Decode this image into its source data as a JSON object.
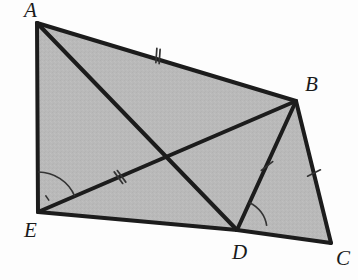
{
  "figure": {
    "kind": "geometry-diagram",
    "width": 358,
    "height": 280,
    "background_color": "#fdfdfd",
    "fill_color": "#b9b9b9",
    "stroke_color": "#1c1c1c",
    "thin_stroke_color": "#333333"
  },
  "vertices": [
    {
      "name": "A",
      "x": 37,
      "y": 23,
      "label": "A",
      "label_x": 24,
      "label_y": 0
    },
    {
      "name": "B",
      "x": 296,
      "y": 101,
      "label": "B",
      "label_x": 305,
      "label_y": 74
    },
    {
      "name": "C",
      "x": 331,
      "y": 243,
      "label": "C",
      "label_x": 336,
      "label_y": 248
    },
    {
      "name": "D",
      "x": 237,
      "y": 230,
      "label": "D",
      "label_x": 232,
      "label_y": 242
    },
    {
      "name": "E",
      "x": 38,
      "y": 212,
      "label": "E",
      "label_x": 24,
      "label_y": 220
    }
  ],
  "polygon": {
    "name": "pentagon-abcde",
    "points": "37,23 296,101 331,243 237,230 38,212"
  },
  "segments": [
    {
      "name": "side-AB",
      "from": "A",
      "to": "B",
      "x1": 37,
      "y1": 23,
      "x2": 296,
      "y2": 101,
      "width": 4
    },
    {
      "name": "side-BC",
      "from": "B",
      "to": "C",
      "x1": 296,
      "y1": 101,
      "x2": 331,
      "y2": 243,
      "width": 4
    },
    {
      "name": "side-CD",
      "from": "C",
      "to": "D",
      "x1": 331,
      "y1": 243,
      "x2": 237,
      "y2": 230,
      "width": 4
    },
    {
      "name": "side-DE",
      "from": "D",
      "to": "E",
      "x1": 237,
      "y1": 230,
      "x2": 38,
      "y2": 212,
      "width": 4
    },
    {
      "name": "side-EA",
      "from": "E",
      "to": "A",
      "x1": 38,
      "y1": 212,
      "x2": 37,
      "y2": 23,
      "width": 4
    },
    {
      "name": "diagonal-AD",
      "from": "A",
      "to": "D",
      "x1": 37,
      "y1": 23,
      "x2": 237,
      "y2": 230,
      "width": 4
    },
    {
      "name": "diagonal-EB",
      "from": "E",
      "to": "B",
      "x1": 38,
      "y1": 212,
      "x2": 296,
      "y2": 101,
      "width": 4
    },
    {
      "name": "segment-BD",
      "from": "B",
      "to": "D",
      "x1": 296,
      "y1": 101,
      "x2": 237,
      "y2": 230,
      "width": 4
    }
  ],
  "tick_marks": [
    {
      "name": "tick-AB",
      "on_segment": "side-AB",
      "count": 2,
      "cx": 158,
      "cy": 56,
      "angle_deg": 16.8
    },
    {
      "name": "tick-EB",
      "on_segment": "diagonal-EB",
      "count": 2,
      "cx": 120,
      "cy": 177,
      "angle_deg": -23.3
    },
    {
      "name": "tick-BD",
      "on_segment": "segment-BD",
      "count": 1,
      "cx": 267,
      "cy": 166,
      "angle_deg": 65.4
    },
    {
      "name": "tick-BC",
      "on_segment": "side-BC",
      "count": 1,
      "cx": 314,
      "cy": 173,
      "angle_deg": 76.1
    }
  ],
  "angle_marks": [
    {
      "name": "angle-at-E",
      "vertex": "E",
      "between": [
        "EA",
        "EB"
      ],
      "radius": 40,
      "start_deg": -89.7,
      "end_deg": -23.3,
      "has_inner_dot": true
    },
    {
      "name": "angle-at-D",
      "vertex": "D",
      "between": [
        "DB",
        "DC"
      ],
      "radius": 30,
      "start_deg": -65.4,
      "end_deg": -7.9,
      "has_inner_dot": false
    }
  ],
  "intersection": {
    "name": "diagonal-crossing",
    "x": 167,
    "y": 157
  }
}
